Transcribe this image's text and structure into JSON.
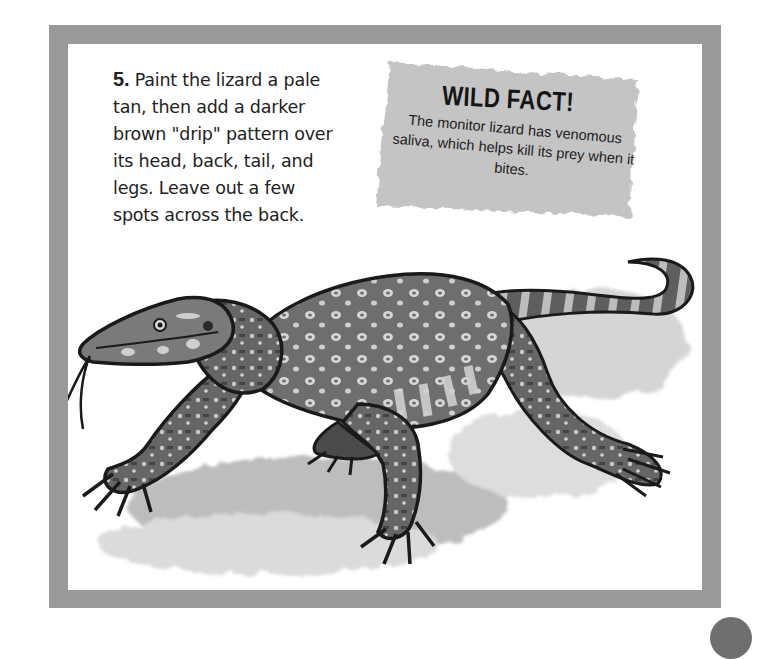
{
  "instruction": {
    "step_number": "5.",
    "text": "Paint the lizard a pale tan, then add a darker brown \"drip\" pattern over its head, back, tail, and legs. Leave out a few spots across the back."
  },
  "wild_fact": {
    "title": "WILD FACT!",
    "body": "The monitor lizard has venomous saliva, which helps kill its prey when it bites."
  },
  "illustration": {
    "subject": "monitor lizard",
    "description": "Painted monitor lizard walking with tongue out, spotted back, banded tail"
  },
  "colors": {
    "frame": "#9a9a9a",
    "fact_box": "#c4c4c4",
    "page_marker": "#6f6f6f"
  }
}
